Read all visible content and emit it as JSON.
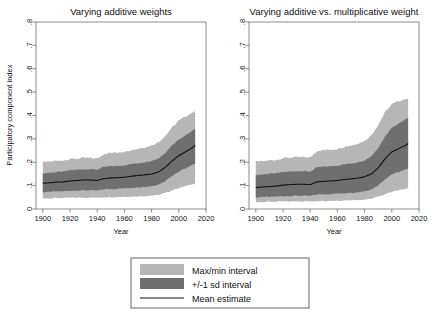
{
  "figure": {
    "background": "#ffffff",
    "colors": {
      "outer_band": "#b6b6b6",
      "inner_band": "#6f6f6f",
      "mean_line": "#111111",
      "frame": "#6e6e6e"
    }
  },
  "legend": {
    "items": [
      {
        "label": "Max/min interval",
        "marker": "swatch",
        "color": "#b6b6b6"
      },
      {
        "label": "+/-1 sd interval",
        "marker": "swatch",
        "color": "#6f6f6f"
      },
      {
        "label": "Mean estimate",
        "marker": "line",
        "color": "#111111"
      }
    ]
  },
  "chart_data": [
    {
      "type": "area",
      "title": "Varying additive weights",
      "xlabel": "Year",
      "ylabel": "Participatory component index",
      "xlim": [
        1895,
        2020
      ],
      "ylim": [
        0,
        0.8
      ],
      "xticks": [
        1900,
        1920,
        1940,
        1960,
        1980,
        2000,
        2020
      ],
      "xticklabels": [
        "1900",
        "1920",
        "1940",
        "1960",
        "1980",
        "2000",
        "2020"
      ],
      "yticks": [
        0,
        0.1,
        0.2,
        0.3,
        0.4,
        0.5,
        0.6,
        0.7,
        0.8
      ],
      "yticklabels": [
        "0",
        ".1",
        ".2",
        ".3",
        ".4",
        ".5",
        ".6",
        ".7",
        ".8"
      ],
      "grid": false,
      "x": [
        1900,
        1905,
        1910,
        1915,
        1920,
        1925,
        1930,
        1935,
        1940,
        1945,
        1950,
        1955,
        1960,
        1965,
        1970,
        1975,
        1980,
        1985,
        1990,
        1995,
        2000,
        2005,
        2010,
        2012
      ],
      "series": [
        {
          "name": "Mean estimate",
          "values": [
            0.11,
            0.112,
            0.115,
            0.116,
            0.12,
            0.122,
            0.124,
            0.124,
            0.122,
            0.13,
            0.133,
            0.134,
            0.136,
            0.14,
            0.143,
            0.146,
            0.15,
            0.158,
            0.178,
            0.205,
            0.228,
            0.245,
            0.262,
            0.272
          ]
        },
        {
          "name": "+1 sd",
          "values": [
            0.152,
            0.155,
            0.158,
            0.16,
            0.166,
            0.168,
            0.17,
            0.17,
            0.168,
            0.18,
            0.183,
            0.184,
            0.187,
            0.192,
            0.196,
            0.2,
            0.206,
            0.216,
            0.24,
            0.272,
            0.298,
            0.316,
            0.334,
            0.344
          ]
        },
        {
          "name": "-1 sd",
          "values": [
            0.072,
            0.073,
            0.075,
            0.076,
            0.078,
            0.079,
            0.08,
            0.08,
            0.079,
            0.084,
            0.086,
            0.087,
            0.088,
            0.091,
            0.093,
            0.095,
            0.098,
            0.104,
            0.12,
            0.142,
            0.16,
            0.174,
            0.188,
            0.196
          ]
        },
        {
          "name": "Max",
          "values": [
            0.2,
            0.203,
            0.206,
            0.208,
            0.214,
            0.216,
            0.218,
            0.218,
            0.216,
            0.236,
            0.24,
            0.242,
            0.246,
            0.252,
            0.258,
            0.264,
            0.272,
            0.286,
            0.312,
            0.348,
            0.378,
            0.396,
            0.412,
            0.42
          ]
        },
        {
          "name": "Min",
          "values": [
            0.046,
            0.046,
            0.047,
            0.047,
            0.048,
            0.048,
            0.049,
            0.049,
            0.048,
            0.05,
            0.051,
            0.051,
            0.052,
            0.053,
            0.054,
            0.055,
            0.057,
            0.06,
            0.068,
            0.08,
            0.09,
            0.098,
            0.106,
            0.11
          ]
        }
      ]
    },
    {
      "type": "area",
      "title": "Varying additive vs. multiplicative weight",
      "xlabel": "Year",
      "ylabel": "",
      "xlim": [
        1895,
        2020
      ],
      "ylim": [
        0,
        0.8
      ],
      "xticks": [
        1900,
        1920,
        1940,
        1960,
        1980,
        2000,
        2020
      ],
      "xticklabels": [
        "1900",
        "1920",
        "1940",
        "1960",
        "1980",
        "2000",
        "2020"
      ],
      "yticks": [
        0,
        0.1,
        0.2,
        0.3,
        0.4,
        0.5,
        0.6,
        0.7,
        0.8
      ],
      "yticklabels": [
        "0",
        ".1",
        ".2",
        ".3",
        ".4",
        ".5",
        ".6",
        ".7",
        ".8"
      ],
      "grid": false,
      "x": [
        1900,
        1905,
        1910,
        1915,
        1920,
        1925,
        1930,
        1935,
        1940,
        1945,
        1950,
        1955,
        1960,
        1965,
        1970,
        1975,
        1980,
        1985,
        1990,
        1995,
        2000,
        2005,
        2010,
        2012
      ],
      "series": [
        {
          "name": "Mean estimate",
          "values": [
            0.092,
            0.094,
            0.096,
            0.098,
            0.102,
            0.104,
            0.106,
            0.106,
            0.104,
            0.116,
            0.118,
            0.12,
            0.122,
            0.126,
            0.129,
            0.132,
            0.138,
            0.15,
            0.176,
            0.214,
            0.244,
            0.258,
            0.272,
            0.28
          ]
        },
        {
          "name": "+1 sd",
          "values": [
            0.146,
            0.148,
            0.151,
            0.153,
            0.158,
            0.16,
            0.162,
            0.162,
            0.16,
            0.178,
            0.181,
            0.183,
            0.186,
            0.191,
            0.195,
            0.2,
            0.208,
            0.226,
            0.262,
            0.31,
            0.348,
            0.366,
            0.382,
            0.39
          ]
        },
        {
          "name": "-1 sd",
          "values": [
            0.05,
            0.051,
            0.052,
            0.053,
            0.055,
            0.056,
            0.057,
            0.057,
            0.056,
            0.062,
            0.063,
            0.064,
            0.066,
            0.068,
            0.07,
            0.072,
            0.076,
            0.084,
            0.102,
            0.128,
            0.148,
            0.158,
            0.168,
            0.174
          ]
        },
        {
          "name": "Max",
          "values": [
            0.202,
            0.205,
            0.208,
            0.21,
            0.218,
            0.22,
            0.222,
            0.222,
            0.22,
            0.248,
            0.252,
            0.254,
            0.258,
            0.266,
            0.272,
            0.28,
            0.292,
            0.316,
            0.36,
            0.414,
            0.448,
            0.462,
            0.47,
            0.472
          ]
        },
        {
          "name": "Min",
          "values": [
            0.03,
            0.03,
            0.031,
            0.031,
            0.032,
            0.032,
            0.033,
            0.033,
            0.032,
            0.034,
            0.035,
            0.035,
            0.036,
            0.037,
            0.038,
            0.039,
            0.04,
            0.044,
            0.052,
            0.064,
            0.074,
            0.08,
            0.086,
            0.09
          ]
        }
      ]
    }
  ]
}
